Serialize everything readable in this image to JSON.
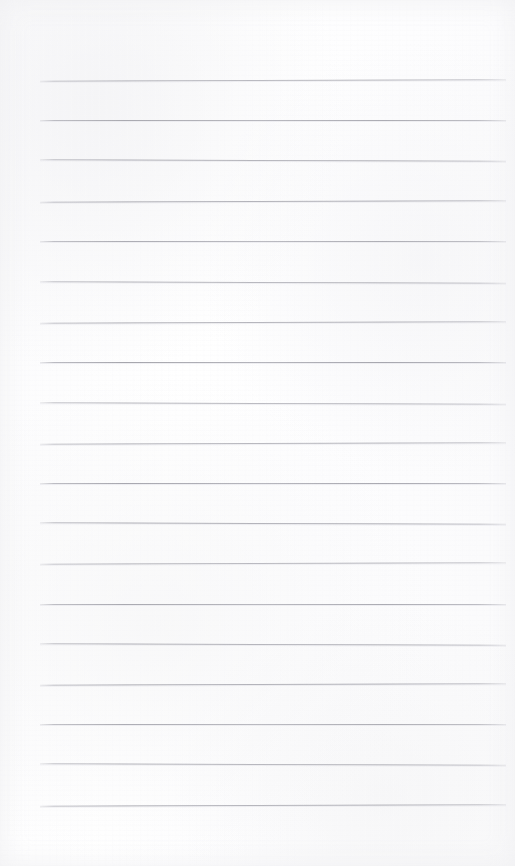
{
  "document": {
    "kind": "blank-lined-paper-scan",
    "title": "Blank Lined Notebook Page",
    "page_width": 515,
    "page_height": 866,
    "background_color": "#fdfdfd",
    "has_text_content": false,
    "has_handwriting": false,
    "has_header": false,
    "has_footer": false,
    "has_page_number": false,
    "has_margin_rule": false
  },
  "ruling": {
    "style": "horizontal-ruled",
    "line_color": "#a8a8b0",
    "line_thickness_px": 1,
    "line_count": 19,
    "line_spacing_px": 40,
    "first_line_y": 80,
    "last_line_y": 800,
    "line_start_x": 40,
    "line_end_x": 506,
    "top_margin_px": 80,
    "bottom_margin_px": 66,
    "left_margin_px": 40,
    "right_margin_px": 9,
    "lines_y": [
      80,
      120,
      160,
      201,
      241,
      282,
      322,
      362,
      403,
      443,
      483,
      523,
      563,
      604,
      644,
      684,
      724,
      764,
      805
    ]
  }
}
